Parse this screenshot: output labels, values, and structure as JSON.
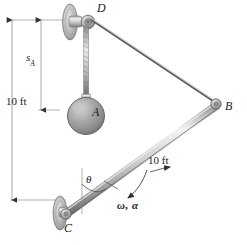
{
  "figure": {
    "type": "engineering-mechanics-diagram",
    "background_color": "#ffffff",
    "line_color": "#3a3a3a",
    "metal_light": "#e8e8e8",
    "metal_mid": "#b5b5b5",
    "metal_dark": "#7a7a7a"
  },
  "labels": {
    "point_d": "D",
    "point_a": "A",
    "point_b": "B",
    "point_c": "C",
    "distance_sa": "s",
    "distance_sa_sub": "A",
    "height_10ft": "10 ft",
    "bar_length_10ft": "10 ft",
    "angle_theta": "θ",
    "omega_alpha": "ω, α"
  },
  "geometry": {
    "pulley_d": {
      "x": 88,
      "y": 22,
      "r": 6
    },
    "sphere_a": {
      "x": 75,
      "y": 113,
      "r": 18
    },
    "pin_b": {
      "x": 216,
      "y": 104,
      "r": 5
    },
    "pin_c": {
      "x": 63,
      "y": 215,
      "r": 5
    },
    "cable_db": {
      "x1": 92,
      "y1": 22,
      "x2": 214,
      "y2": 103
    },
    "cable_da": {
      "x1": 86,
      "y1": 26,
      "x2": 77,
      "y2": 96
    },
    "bar_cb": {
      "x1": 63,
      "y1": 215,
      "x2": 216,
      "y2": 104,
      "length_label": "10 ft"
    },
    "dim_10ft_line": {
      "x": 12,
      "y_top": 20,
      "y_bottom": 200
    },
    "dim_sa_line": {
      "x": 41,
      "y_top": 20,
      "y_bottom": 110
    }
  },
  "dimension_values": {
    "vertical_drop_ft": 10,
    "bar_length_ft": 10,
    "sa_symbol": "sA",
    "angular_velocity_symbol": "ω",
    "angular_acceleration_symbol": "α",
    "angle_symbol": "θ"
  }
}
